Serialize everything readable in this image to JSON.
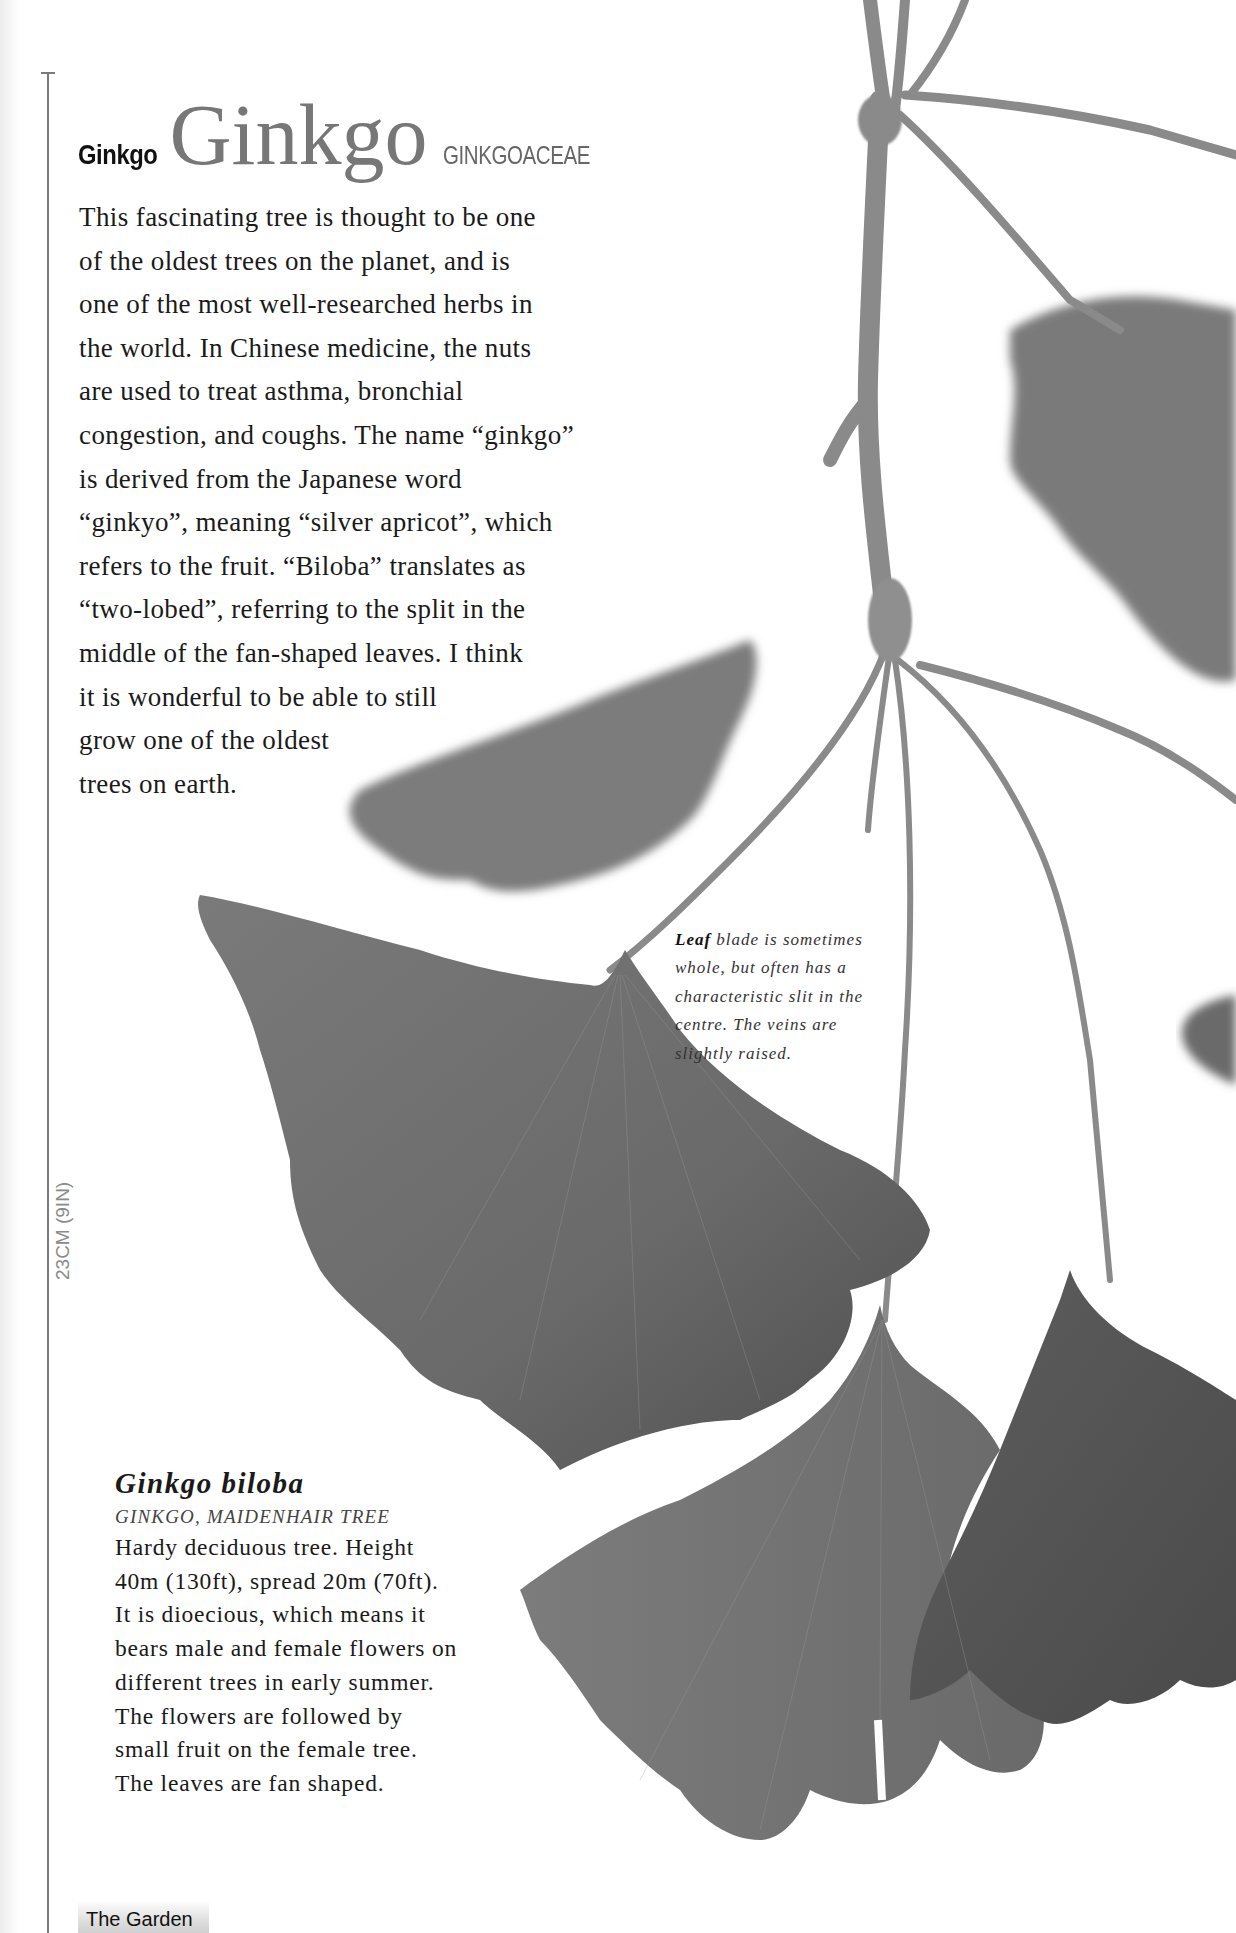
{
  "header": {
    "common_name": "Ginkgo",
    "genus": "Ginkgo",
    "family": "GINKGOACEAE"
  },
  "intro": {
    "lines": [
      "This fascinating tree is thought to be one",
      "of the oldest trees on the planet, and is",
      "one of the most well-researched herbs in",
      "the world. In Chinese medicine, the nuts",
      "are used to treat asthma, bronchial",
      "congestion, and coughs. The name “ginkgo”",
      "is derived from the Japanese word",
      "“ginkyo”, meaning “silver apricot”, which",
      "refers to the fruit. “Biloba” translates as",
      "“two-lobed”, referring to the split in the",
      "middle of the fan-shaped leaves. I think",
      "it is wonderful to be able to still",
      "grow one of the oldest",
      "trees on earth."
    ]
  },
  "caption": {
    "lead": "Leaf",
    "first_rest": " blade is sometimes",
    "lines": [
      "whole, but often has a",
      "characteristic slit in the",
      "centre. The veins are",
      "slightly raised."
    ]
  },
  "species": {
    "name": "Ginkgo biloba",
    "common_names": "GINKGO, MAIDENHAIR TREE",
    "lines": [
      "Hardy deciduous tree. Height",
      "40m (130ft), spread 20m (70ft).",
      "It is dioecious, which means it",
      "bears male and female flowers on",
      "different trees in early summer.",
      "The flowers are followed by",
      "small fruit on the female tree.",
      "The leaves are fan shaped."
    ]
  },
  "scale": {
    "label": "23CM (9IN)"
  },
  "footer": {
    "section": "The Garden"
  },
  "colors": {
    "leaf_dark": "#5a5a5a",
    "leaf_mid": "#6e6e6e",
    "leaf_light": "#8a8a8a",
    "stem": "#888888"
  }
}
